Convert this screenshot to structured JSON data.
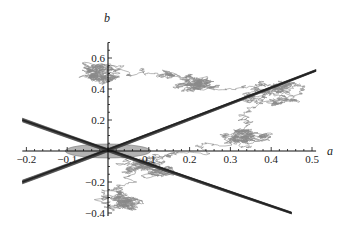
{
  "chart_data": {
    "type": "line",
    "title": "",
    "xlabel": "a",
    "ylabel": "b",
    "xlim": [
      -0.21,
      0.51
    ],
    "ylim": [
      -0.42,
      0.7
    ],
    "x_ticks": [
      -0.2,
      -0.1,
      0.1,
      0.2,
      0.3,
      0.4,
      0.5
    ],
    "x_tick_labels": [
      "-0.2",
      "-0.1",
      "0.1",
      "0.2",
      "0.3",
      "0.4",
      "0.5"
    ],
    "y_ticks": [
      0.6,
      0.4,
      0.2,
      -0.2,
      -0.4
    ],
    "y_tick_labels": [
      "0.6",
      "0.4",
      "0.2",
      "-0.2",
      "-0.4"
    ],
    "grid": false,
    "legend": null,
    "series": [
      {
        "name": "stability-boundary-rising",
        "kind": "wedge-band",
        "color": "#3a3a3a",
        "from": [
          -0.21,
          -0.2
        ],
        "to": [
          0.51,
          0.52
        ]
      },
      {
        "name": "stability-boundary-falling",
        "kind": "wedge-band",
        "color": "#3a3a3a",
        "from": [
          -0.21,
          0.2
        ],
        "to": [
          0.45,
          -0.4
        ]
      },
      {
        "name": "ellipse-region",
        "kind": "filled-ellipse",
        "color": "#9a9a9a",
        "center": [
          0,
          0
        ],
        "rx": 0.105,
        "ry": 0.045
      },
      {
        "name": "random-walk",
        "kind": "random-walk-path",
        "color": "#8a8a8a",
        "clusters": [
          {
            "center": [
              -0.03,
              0.5
            ],
            "spread": [
              0.07,
              0.05
            ]
          },
          {
            "center": [
              0.22,
              0.44
            ],
            "spread": [
              0.1,
              0.08
            ]
          },
          {
            "center": [
              0.42,
              0.37
            ],
            "spread": [
              0.04,
              0.03
            ]
          },
          {
            "center": [
              0.36,
              0.08
            ],
            "spread": [
              0.06,
              0.09
            ]
          },
          {
            "center": [
              0.1,
              -0.1
            ],
            "spread": [
              0.06,
              0.03
            ]
          },
          {
            "center": [
              0.03,
              -0.3
            ],
            "spread": [
              0.1,
              0.06
            ]
          }
        ]
      }
    ]
  }
}
